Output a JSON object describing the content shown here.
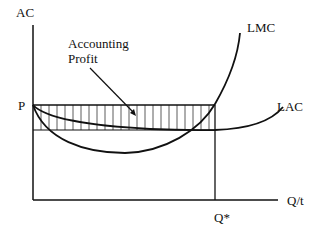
{
  "diagram": {
    "axes": {
      "y_label": "AC",
      "x_label": "Q/t"
    },
    "levels": {
      "price_label": "P",
      "quantity_label": "Q*"
    },
    "curves": [
      {
        "name": "LMC",
        "label": "LMC"
      },
      {
        "name": "LAC",
        "label": "LAC"
      }
    ],
    "annotation": {
      "line1": "Accounting",
      "line2": "Profit"
    },
    "colors": {
      "ink": "#111111",
      "background": "#ffffff"
    }
  }
}
